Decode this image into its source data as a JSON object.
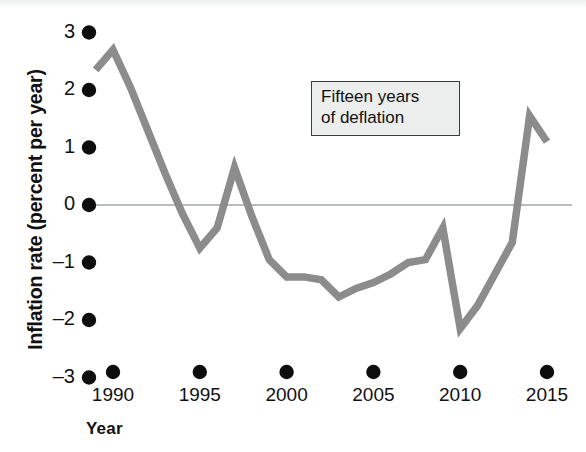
{
  "chart_data": {
    "type": "line",
    "title": "",
    "xlabel": "Year",
    "ylabel": "Inflation rate (percent per year)",
    "xlim": [
      1988.7,
      2015.6
    ],
    "ylim": [
      -3,
      3
    ],
    "grid": false,
    "legend": "none",
    "zero_line": true,
    "series": [
      {
        "name": "Inflation rate",
        "color": "#8c8c8c",
        "x": [
          1989.0,
          1990.0,
          1991.0,
          1992.0,
          1993.0,
          1994.0,
          1995.0,
          1996.0,
          1997.0,
          1998.0,
          1999.0,
          2000.0,
          2001.0,
          2002.0,
          2003.0,
          2004.0,
          2005.0,
          2006.0,
          2007.0,
          2008.0,
          2009.0,
          2010.0,
          2011.0,
          2012.0,
          2013.0,
          2014.0,
          2015.0
        ],
        "values": [
          2.35,
          2.7,
          2.05,
          1.3,
          0.55,
          -0.15,
          -0.75,
          -0.4,
          0.65,
          -0.2,
          -0.95,
          -1.25,
          -1.25,
          -1.3,
          -1.6,
          -1.45,
          -1.35,
          -1.2,
          -1.0,
          -0.95,
          -0.4,
          -2.15,
          -1.75,
          -1.2,
          -0.65,
          1.55,
          1.1
        ]
      }
    ],
    "yticks": [
      3,
      2,
      1,
      0,
      -1,
      -2,
      -3
    ],
    "ytick_labels": [
      "3",
      "2",
      "1",
      "0",
      "–1",
      "–2",
      "–3"
    ],
    "xticks": [
      1990,
      1995,
      2000,
      2005,
      2010,
      2015
    ],
    "xtick_labels": [
      "1990",
      "1995",
      "2000",
      "2005",
      "2010",
      "2015"
    ],
    "annotations": [
      {
        "name": "deflation-callout",
        "lines": [
          "Fifteen years",
          "of deflation"
        ],
        "border_color": "#3b3b3b",
        "fill_color": "#eceeee"
      }
    ],
    "colors": {
      "line": "#8c8c8c",
      "zero_line": "#b9bcbd",
      "tick_dot": "#0d0d0d",
      "text": "#111111",
      "background": "#ffffff"
    }
  }
}
